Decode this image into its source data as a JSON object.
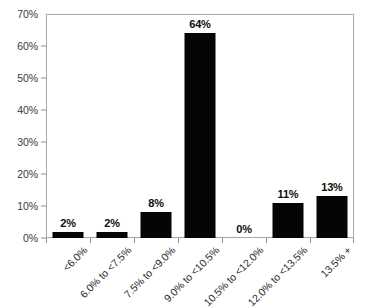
{
  "chart_data": {
    "type": "bar",
    "title": "",
    "subtitle": "",
    "xlabel": "",
    "ylabel": "",
    "categories": [
      "<6.0%",
      "6.0% to <7.5%",
      "7.5% to <9.0%",
      "9.0% to <10.5%",
      "10.5% to <12.0%",
      "12.0% to <13.5%",
      "13.5% +"
    ],
    "values": [
      2,
      2,
      8,
      64,
      0,
      11,
      13
    ],
    "data_labels": [
      "2%",
      "2%",
      "8%",
      "64%",
      "0%",
      "11%",
      "13%"
    ],
    "ylim": [
      0,
      70
    ],
    "yticks": [
      0,
      10,
      20,
      30,
      40,
      50,
      60,
      70
    ],
    "ytick_labels": [
      "0%",
      "10%",
      "20%",
      "30%",
      "40%",
      "50%",
      "60%",
      "70%"
    ],
    "grid": false,
    "legend": null,
    "bar_color": "#050505",
    "axis_color": "#a8a8a8",
    "background_color": "#ffffff",
    "xtick_label_rotation": -45
  }
}
